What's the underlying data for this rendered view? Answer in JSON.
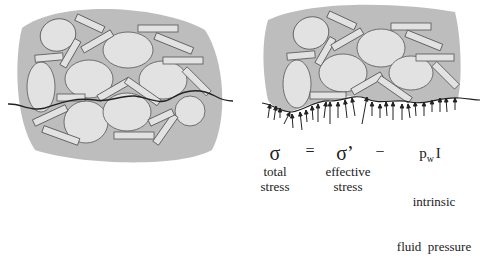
{
  "diagram": {
    "left_panel": {
      "description": "soil grain skeleton with wavy cross-section line"
    },
    "right_panel": {
      "description": "cut section with total stress arrows acting on boundary"
    },
    "equation": {
      "total_symbol": "σ",
      "equals": "=",
      "effective_symbol": "σ’",
      "minus": "−",
      "pressure_symbol_p": "p",
      "pressure_symbol_sub": "w",
      "pressure_symbol_I": "I",
      "total_label_1": "total",
      "total_label_2": "stress",
      "effective_label_1": "effective",
      "effective_label_2": "stress",
      "pressure_label_1": "intrinsic",
      "pressure_label_2": "fluid  pressure"
    },
    "colors": {
      "matrix": "#bdbdbd",
      "grain": "#e2e2e2",
      "outline": "#555555",
      "line": "#222222"
    }
  }
}
